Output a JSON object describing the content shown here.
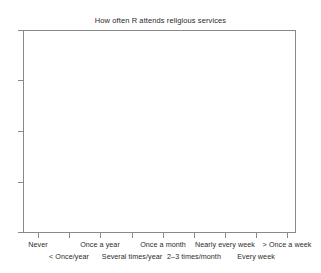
{
  "chart_data": {
    "type": "bar",
    "title": "How often R attends religious services",
    "xlabel": "",
    "ylabel": "",
    "categories": [
      "Never",
      "< Once/year",
      "Once a year",
      "Several times/year",
      "Once a month",
      "2–3 times/month",
      "Nearly every week",
      "Every week",
      "> Once a week"
    ],
    "values": [
      null,
      null,
      null,
      null,
      null,
      null,
      null,
      null,
      null
    ],
    "series": [
      {
        "name": "",
        "values": [
          null,
          null,
          null,
          null,
          null,
          null,
          null,
          null,
          null
        ]
      }
    ],
    "annotations": [],
    "grid": false,
    "legend": false,
    "legend_position": "none",
    "x_tick_labels": [
      "Never",
      "< Once/year",
      "Once a year",
      "Several times/year",
      "Once a month",
      "2–3 times/month",
      "Nearly every week",
      "Every week",
      "> Once a week"
    ],
    "y_tick_labels": [
      "",
      "",
      "",
      ""
    ],
    "note": "Empty plotting region — axes and labels drawn, no data series rendered"
  },
  "figure": {
    "title": "How often R attends religious services",
    "background_color": "#ffffff",
    "axis_color": "#898989",
    "text_color": "#2b2b2b"
  },
  "axes": {
    "x": {
      "ticks": [
        {
          "label": "Never",
          "row": 1,
          "x": 38
        },
        {
          "label": "< Once/year",
          "row": 2,
          "x": 69
        },
        {
          "label": "Once a year",
          "row": 1,
          "x": 100
        },
        {
          "label": "Several times/year",
          "row": 2,
          "x": 132
        },
        {
          "label": "Once a month",
          "row": 1,
          "x": 163
        },
        {
          "label": "2–3 times/month",
          "row": 2,
          "x": 194
        },
        {
          "label": "Nearly every week",
          "row": 1,
          "x": 225
        },
        {
          "label": "Every week",
          "row": 2,
          "x": 256
        },
        {
          "label": "> Once a week",
          "row": 1,
          "x": 287
        }
      ]
    },
    "y": {
      "ticks": [
        {
          "label": "",
          "y": 30
        },
        {
          "label": "",
          "y": 80
        },
        {
          "label": "",
          "y": 131
        },
        {
          "label": "",
          "y": 182
        },
        {
          "label": "",
          "y": 232
        }
      ]
    }
  }
}
